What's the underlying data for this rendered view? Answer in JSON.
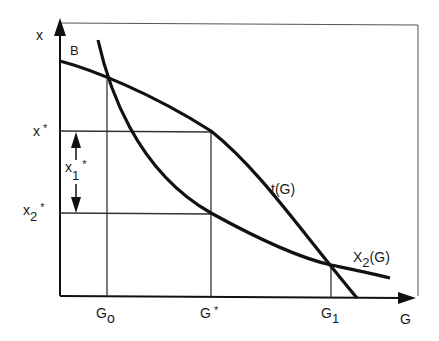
{
  "diagram": {
    "y_axis_label": "x",
    "x_axis_label": "G",
    "point_label_B": "B",
    "y_ticks": {
      "x_star": {
        "base": "x",
        "sup": "*"
      },
      "x2_star": {
        "base": "x",
        "sub": "2",
        "sup": "*"
      }
    },
    "x_ticks": {
      "g0": {
        "base": "G",
        "sub": "o"
      },
      "g_star": {
        "base": "G",
        "sup": "*"
      },
      "g1": {
        "base": "G",
        "sub": "1"
      }
    },
    "interval_label": {
      "base": "x",
      "sub": "1",
      "sup": "*"
    },
    "curves": {
      "t_label": "t(G)",
      "x2_label_base": "X",
      "x2_label_sub": "2",
      "x2_label_tail": "(G)"
    },
    "colors": {
      "curve": "#111111",
      "grid": "#333333",
      "background": "#ffffff"
    }
  }
}
